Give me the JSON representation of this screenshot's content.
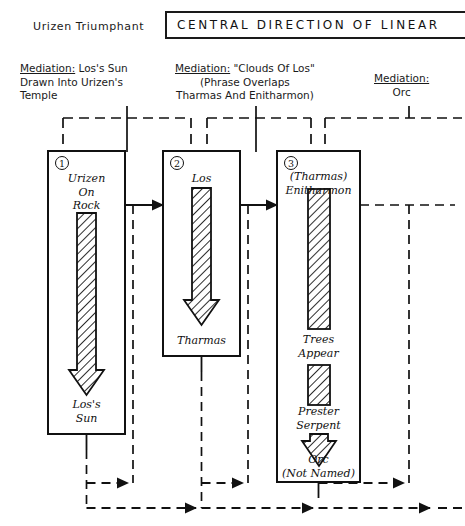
{
  "header": {
    "left_caption": "Urizen Triumphant",
    "banner_text": "CENTRAL  DIRECTION  OF  LINEAR"
  },
  "mediations": [
    {
      "id": "mediation-1",
      "label": "Mediation:",
      "line1": " Los's Sun",
      "line2": "Drawn Into Urizen's",
      "line3": "Temple"
    },
    {
      "id": "mediation-2",
      "label": "Mediation:",
      "line1": " \"Clouds Of Los\"",
      "line2": "(Phrase Overlaps",
      "line3": "Tharmas And Enitharmon)"
    },
    {
      "id": "mediation-3",
      "label": "Mediation:",
      "line1": "",
      "line2": "Orc",
      "line3": ""
    }
  ],
  "columns": [
    {
      "id": "column-1",
      "number": "1",
      "top_label_lines": [
        "Urizen",
        "On",
        "Rock"
      ],
      "stages": [
        {
          "kind": "arrow",
          "name": "urizen-to-los-sun-arrow"
        },
        {
          "kind": "label",
          "text_lines": [
            "Los's",
            "Sun"
          ]
        }
      ]
    },
    {
      "id": "column-2",
      "number": "2",
      "top_label_lines": [
        "Los"
      ],
      "stages": [
        {
          "kind": "arrow",
          "name": "los-to-tharmas-arrow"
        },
        {
          "kind": "label",
          "text_lines": [
            "Tharmas"
          ]
        }
      ]
    },
    {
      "id": "column-3",
      "number": "3",
      "top_label_lines": [
        "(Tharmas)",
        "Enitharmon"
      ],
      "stages": [
        {
          "kind": "bar",
          "name": "enitharmon-bar"
        },
        {
          "kind": "label",
          "text_lines": [
            "Trees",
            "Appear"
          ]
        },
        {
          "kind": "bar",
          "name": "trees-bar"
        },
        {
          "kind": "label",
          "text_lines": [
            "Prester",
            "Serpent"
          ]
        },
        {
          "kind": "arrow",
          "name": "prester-to-orc-arrow"
        },
        {
          "kind": "label",
          "text_lines": [
            "Orc",
            "(Not Named)"
          ]
        }
      ]
    }
  ],
  "colors": {
    "ink": "#111111",
    "paper": "#ffffff",
    "hatch": "#222222"
  }
}
